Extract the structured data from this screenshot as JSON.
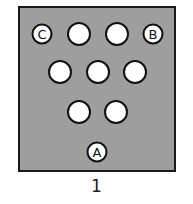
{
  "figure": {
    "caption": "1",
    "board_color": "#9e9e9e",
    "coins": [
      {
        "id": "C",
        "label": "C",
        "x": 42,
        "y": 34,
        "small": true
      },
      {
        "id": "r1c2",
        "label": "",
        "x": 79,
        "y": 34
      },
      {
        "id": "r1c3",
        "label": "",
        "x": 117,
        "y": 34
      },
      {
        "id": "B",
        "label": "B",
        "x": 153,
        "y": 34,
        "small": true
      },
      {
        "id": "r2c1",
        "label": "",
        "x": 60,
        "y": 72
      },
      {
        "id": "r2c2",
        "label": "",
        "x": 98,
        "y": 72
      },
      {
        "id": "r2c3",
        "label": "",
        "x": 135,
        "y": 72
      },
      {
        "id": "r3c1",
        "label": "",
        "x": 79,
        "y": 112
      },
      {
        "id": "r3c2",
        "label": "",
        "x": 116,
        "y": 112
      },
      {
        "id": "A",
        "label": "A",
        "x": 97,
        "y": 152,
        "small": true
      }
    ]
  }
}
